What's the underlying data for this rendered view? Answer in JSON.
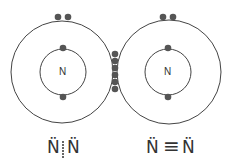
{
  "diagram": {
    "atoms": [
      {
        "symbol": "N",
        "outer": {
          "cx": 62,
          "cy": 72,
          "r": 51
        },
        "inner": {
          "cx": 63,
          "cy": 72,
          "r": 23
        },
        "lone_pair": [
          [
            58,
            17
          ],
          [
            68,
            17
          ]
        ],
        "inner_electrons": [
          [
            63,
            48
          ],
          [
            63,
            97
          ]
        ]
      },
      {
        "symbol": "N",
        "outer": {
          "cx": 169,
          "cy": 72,
          "r": 52
        },
        "inner": {
          "cx": 168,
          "cy": 72,
          "r": 23
        },
        "lone_pair": [
          [
            163,
            17
          ],
          [
            173,
            17
          ]
        ],
        "inner_electrons": [
          [
            168,
            48
          ],
          [
            168,
            97
          ]
        ]
      }
    ],
    "shared_electrons": [
      [
        115,
        54
      ],
      [
        115,
        61
      ],
      [
        115,
        68
      ],
      [
        115,
        75
      ],
      [
        115,
        82
      ],
      [
        115,
        89
      ]
    ],
    "colors": {
      "line": "#444444",
      "electron": "#555555"
    }
  },
  "labels": {
    "left_atom": "N",
    "right_atom": "N",
    "dot_formula_left": "N̈",
    "dot_formula_right": "N̈",
    "line_formula_left": "N̈",
    "line_formula_bond": "≡",
    "line_formula_right": "N̈"
  }
}
